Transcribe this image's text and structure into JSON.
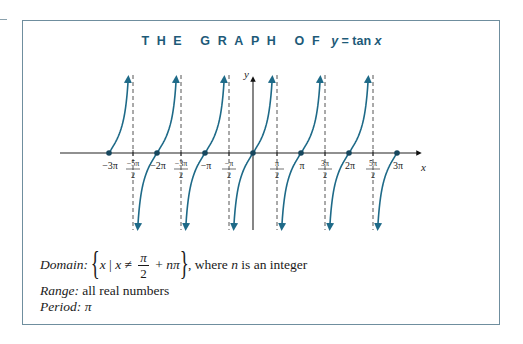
{
  "title": {
    "caps": "THE GRAPH OF",
    "equation_lhs": "y",
    "equation_mid": " = tan ",
    "equation_var": "x"
  },
  "colors": {
    "curve": "#1e6a88",
    "title": "#1d5a78",
    "frame": "#6f8e9e",
    "asymptote": "#555555",
    "axis": "#222222"
  },
  "chart_data": {
    "type": "line",
    "function": "y = tan x",
    "xlabel": "x",
    "ylabel": "y",
    "xlim": [
      -3.14159,
      3.5
    ],
    "x_ticks": [
      {
        "value_pi": -3,
        "label": "−3π"
      },
      {
        "value_pi": -2.5,
        "label": "−5π/2",
        "num": "−5π",
        "den": "2"
      },
      {
        "value_pi": -2,
        "label": "−2π"
      },
      {
        "value_pi": -1.5,
        "label": "−3π/2",
        "num": "−3π",
        "den": "2"
      },
      {
        "value_pi": -1,
        "label": "−π"
      },
      {
        "value_pi": -0.5,
        "label": "−π/2",
        "num": "−π",
        "den": "2"
      },
      {
        "value_pi": 0.5,
        "label": "π/2",
        "num": "π",
        "den": "2"
      },
      {
        "value_pi": 1,
        "label": "π"
      },
      {
        "value_pi": 1.5,
        "label": "3π/2",
        "num": "3π",
        "den": "2"
      },
      {
        "value_pi": 2,
        "label": "2π"
      },
      {
        "value_pi": 2.5,
        "label": "5π/2",
        "num": "5π",
        "den": "2"
      },
      {
        "value_pi": 3,
        "label": "3π"
      }
    ],
    "zeros_pi": [
      -3,
      -2,
      -1,
      0,
      1,
      2,
      3
    ],
    "vertical_asymptotes_pi": [
      -2.5,
      -1.5,
      -0.5,
      0.5,
      1.5,
      2.5
    ],
    "branches": [
      {
        "from_pi": -3,
        "to_pi": -2.5,
        "note": "half branch from -3π rising to asymptote -5π/2"
      },
      {
        "from_pi": -2.5,
        "to_pi": -1.5
      },
      {
        "from_pi": -1.5,
        "to_pi": -0.5
      },
      {
        "from_pi": -0.5,
        "to_pi": 0.5
      },
      {
        "from_pi": 0.5,
        "to_pi": 1.5
      },
      {
        "from_pi": 1.5,
        "to_pi": 2.5
      },
      {
        "from_pi": 2.5,
        "to_pi": 3,
        "note": "half branch from asymptote 5π/2 rising to 3π"
      }
    ],
    "grid": false,
    "legend": null
  },
  "info": {
    "domain_label": "Domain:",
    "domain_set_open": "{",
    "domain_x": "x",
    "domain_bar": " | ",
    "domain_x2": "x",
    "domain_neq": " ≠ ",
    "domain_num": "π",
    "domain_den": "2",
    "domain_plus": " + ",
    "domain_n": "n",
    "domain_pi": "π",
    "domain_set_close": "}",
    "domain_tail_1": ", where ",
    "domain_tail_n": "n",
    "domain_tail_2": " is an integer",
    "range_label": "Range:",
    "range_value": " all real numbers",
    "period_label": "Period:",
    "period_value": " π"
  }
}
